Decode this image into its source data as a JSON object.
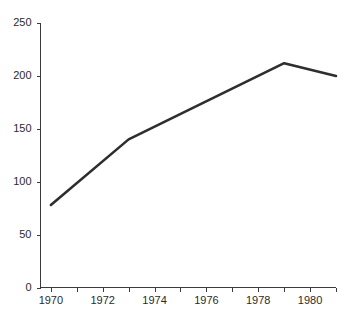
{
  "chart_data": {
    "type": "line",
    "title": "",
    "subtitle": "",
    "xlabel": "",
    "ylabel": "",
    "xlim": [
      1969.6,
      1981.0
    ],
    "ylim": [
      0,
      250
    ],
    "grid": false,
    "legend": null,
    "legend_position": "none",
    "x_tick_labels": [
      "1970",
      "1972",
      "1974",
      "1976",
      "1978",
      "1980"
    ],
    "x_tick_values": [
      1970,
      1972,
      1974,
      1976,
      1978,
      1980
    ],
    "x_minor_tick_values": [
      1971,
      1973,
      1975,
      1977,
      1979,
      1981
    ],
    "y_tick_labels": [
      "0",
      "50",
      "100",
      "150",
      "200",
      "250"
    ],
    "y_tick_values": [
      0,
      50,
      100,
      150,
      200,
      250
    ],
    "series": [
      {
        "name": "series-1",
        "color": "#2e2e2e",
        "x": [
          1970,
          1973,
          1979,
          1981
        ],
        "values": [
          78,
          140,
          212,
          200
        ]
      }
    ],
    "annotations": []
  },
  "axes": {
    "line_color": "#3a3a3a",
    "tick_label_color": "#2b2b2b"
  },
  "canvas": {
    "background": "#ffffff"
  }
}
